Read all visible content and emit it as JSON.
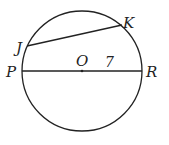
{
  "diagram": {
    "type": "circle-geometry",
    "circle": {
      "center_label": "O",
      "cx": 82,
      "cy": 71,
      "r": 60
    },
    "points": {
      "J": {
        "label": "J",
        "x": 27,
        "y": 46
      },
      "K": {
        "label": "K",
        "x": 122,
        "y": 25
      },
      "P": {
        "label": "P",
        "x": 22,
        "y": 71
      },
      "R": {
        "label": "R",
        "x": 142,
        "y": 71
      },
      "O": {
        "label": "O",
        "x": 82,
        "y": 71
      }
    },
    "segments": [
      {
        "name": "chord-JK",
        "from": "J",
        "to": "K"
      },
      {
        "name": "diameter-PR",
        "from": "P",
        "to": "R"
      }
    ],
    "radius_label": "7",
    "stroke_color": "#222222"
  }
}
